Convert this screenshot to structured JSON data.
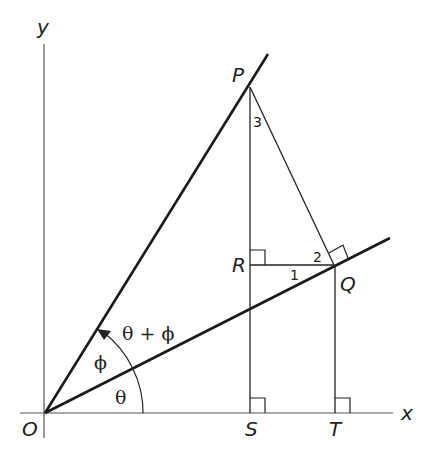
{
  "diagram": {
    "type": "geometry",
    "axes": {
      "x_label": "x",
      "y_label": "y",
      "origin_label": "O"
    },
    "points": {
      "O": "O",
      "P": "P",
      "Q": "Q",
      "R": "R",
      "S": "S",
      "T": "T"
    },
    "angles": {
      "theta": "θ",
      "phi": "ϕ",
      "sum": "θ + ϕ",
      "angle1": "1",
      "angle2": "2",
      "angle3": "3"
    },
    "colors": {
      "line": "#222222",
      "background": "#ffffff"
    }
  }
}
